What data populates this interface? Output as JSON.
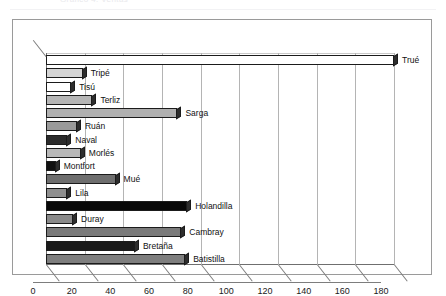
{
  "page": {
    "header_fragment": "Gráfico 4. Ventas"
  },
  "chart_data": {
    "type": "bar",
    "orientation": "horizontal",
    "style": "3d",
    "title": "",
    "subtitle": "",
    "xlabel": "",
    "ylabel": "",
    "xlim": [
      0,
      180
    ],
    "xticks": [
      0,
      20,
      40,
      60,
      80,
      100,
      120,
      140,
      160,
      180
    ],
    "tick_labels": [
      "0",
      "20",
      "40",
      "60",
      "80",
      "100",
      "120",
      "140",
      "160",
      "180"
    ],
    "grid": true,
    "grid_axis": "x",
    "legend": false,
    "legend_position": "none",
    "categories": [
      "Trué",
      "Tripé",
      "Tisú",
      "Terliz",
      "Sarga",
      "Ruán",
      "Naval",
      "Morlés",
      "Montfort",
      "Mué",
      "Lila",
      "Holandilla",
      "Duray",
      "Cambray",
      "Bretaña",
      "Batistilla"
    ],
    "values": [
      180,
      19,
      13,
      24,
      68,
      16,
      11,
      18,
      5,
      36,
      11,
      73,
      14,
      70,
      46,
      72
    ],
    "bar_colors": [
      "#ffffff",
      "#d4d4d4",
      "#ffffff",
      "#b6b6b6",
      "#b0b0b0",
      "#9a9a9a",
      "#2b2b2b",
      "#b8b8b8",
      "#111111",
      "#6e6e6e",
      "#8f8f8f",
      "#080808",
      "#8a8a8a",
      "#7a7a7a",
      "#1a1a1a",
      "#7e7e7e"
    ]
  },
  "colors": {
    "frame": "#9a9a9a",
    "axis": "#6f6f6f",
    "gridline": "#b4b4b4",
    "background": "#ffffff",
    "text": "#111111"
  }
}
